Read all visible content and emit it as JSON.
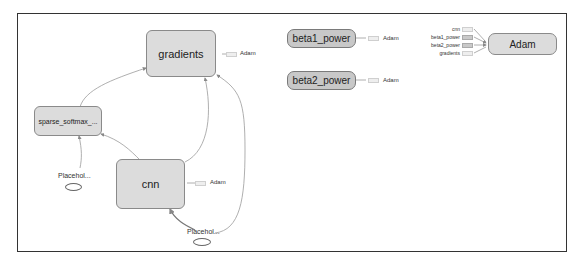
{
  "diagram": {
    "nodes": {
      "gradients": "gradients",
      "sparse_softmax": "sparse_softmax_...",
      "cnn": "cnn",
      "placeholder1": "Placehol...",
      "placeholder2": "Placehol...",
      "beta1_power": "beta1_power",
      "beta2_power": "beta2_power",
      "adam": "Adam"
    },
    "aux_labels": {
      "gradients_to_adam": "Adam",
      "cnn_to_adam": "Adam",
      "beta1_to_adam": "Adam",
      "beta2_to_adam": "Adam"
    },
    "adam_inputs": [
      "cnn",
      "beta1_power",
      "beta2_power",
      "gradients"
    ],
    "edges": [
      {
        "from": "sparse_softmax_...",
        "to": "gradients"
      },
      {
        "from": "cnn",
        "to": "sparse_softmax_..."
      },
      {
        "from": "Placehol...",
        "to": "sparse_softmax_..."
      },
      {
        "from": "cnn",
        "to": "gradients"
      },
      {
        "from": "Placehol...",
        "to": "cnn"
      },
      {
        "from": "Placehol...",
        "to": "gradients"
      }
    ]
  }
}
